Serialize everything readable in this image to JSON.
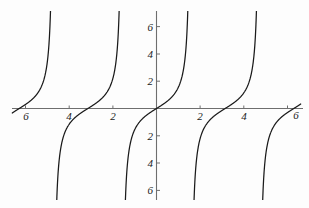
{
  "chart_data": {
    "type": "line",
    "title": "",
    "subtitle": "",
    "xlabel": "",
    "ylabel": "",
    "function": "tan(x)",
    "xlim": [
      -6.6,
      6.6
    ],
    "ylim": [
      -6.8,
      6.8
    ],
    "grid": false,
    "legend": null,
    "x_ticks": [
      {
        "value": -6,
        "label": "6"
      },
      {
        "value": -4,
        "label": "4"
      },
      {
        "value": -2,
        "label": "2"
      },
      {
        "value": 2,
        "label": "2"
      },
      {
        "value": 4,
        "label": "4"
      },
      {
        "value": 6,
        "label": "6"
      }
    ],
    "y_ticks": [
      {
        "value": 6,
        "label": "6"
      },
      {
        "value": 4,
        "label": "4"
      },
      {
        "value": 2,
        "label": "2"
      },
      {
        "value": -2,
        "label": "2"
      },
      {
        "value": -4,
        "label": "4"
      },
      {
        "value": -6,
        "label": "6"
      }
    ],
    "asymptotes": [
      -4.712,
      -1.571,
      1.571,
      4.712
    ],
    "branches": [
      {
        "x_start": -6.6,
        "x_end": -4.712,
        "note": "rises from y=-6.8 off-left edge toward +inf at x=-3pi/2"
      },
      {
        "x_start": -4.712,
        "x_end": -1.571,
        "note": "rises from -inf at x=-3pi/2 through (-pi,0) to +inf at x=-pi/2"
      },
      {
        "x_start": -1.571,
        "x_end": 1.571,
        "note": "rises from -inf at x=-pi/2 through (0,0) to +inf at x=pi/2"
      },
      {
        "x_start": 1.571,
        "x_end": 4.712,
        "note": "rises from -inf at x=pi/2 through (pi,0) to +inf at x=3pi/2"
      },
      {
        "x_start": 4.712,
        "x_end": 6.6,
        "note": "rises from -inf at x=3pi/2 toward right edge"
      }
    ],
    "series": [
      {
        "name": "tan(x)",
        "color": "#1a1a1a",
        "x": [
          -6.6,
          -6.4,
          -6.2,
          -6.0,
          -5.8,
          -5.6,
          -5.4,
          -5.2,
          -5.0,
          -4.9,
          -4.85,
          -4.8,
          -4.76,
          -4.66,
          -4.62,
          -4.56,
          -4.46,
          -4.3,
          -4.1,
          -3.9,
          -3.7,
          -3.5,
          -3.3,
          -3.14,
          -3.0,
          -2.8,
          -2.6,
          -2.4,
          -2.2,
          -2.0,
          -1.85,
          -1.75,
          -1.68,
          -1.62,
          -1.52,
          -1.46,
          -1.4,
          -1.3,
          -1.15,
          -1.0,
          -0.8,
          -0.6,
          -0.4,
          -0.2,
          0.0,
          0.2,
          0.4,
          0.6,
          0.8,
          1.0,
          1.15,
          1.3,
          1.4,
          1.46,
          1.52,
          1.62,
          1.68,
          1.75,
          1.85,
          2.0,
          2.2,
          2.4,
          2.6,
          2.8,
          3.0,
          3.14,
          3.3,
          3.5,
          3.7,
          3.9,
          4.1,
          4.3,
          4.46,
          4.56,
          4.62,
          4.66,
          4.76,
          4.8,
          4.85,
          4.9,
          5.0,
          5.2,
          5.4,
          5.6,
          5.8,
          6.0,
          6.2,
          6.4,
          6.6
        ],
        "y": [
          -0.27,
          -0.48,
          -0.7,
          -0.95,
          -1.26,
          -1.68,
          -2.35,
          -3.74,
          -8.35,
          -20.4,
          -46.1,
          120.0,
          20.0,
          6.6,
          4.9,
          3.5,
          2.37,
          1.53,
          1.03,
          0.74,
          0.51,
          0.33,
          0.15,
          0.0,
          -0.14,
          -0.36,
          -0.6,
          -0.92,
          -1.37,
          -2.19,
          -3.33,
          -5.52,
          -11.1,
          -35.0,
          19.7,
          9.89,
          5.8,
          3.6,
          2.23,
          1.56,
          1.03,
          0.68,
          0.42,
          0.2,
          0.0,
          0.2,
          0.42,
          0.68,
          1.03,
          1.56,
          2.23,
          3.6,
          5.8,
          9.89,
          19.7,
          -35.0,
          -11.1,
          -5.52,
          -3.33,
          -2.19,
          -1.37,
          -0.92,
          -0.6,
          -0.36,
          -0.14,
          0.0,
          0.15,
          0.33,
          0.51,
          0.74,
          1.03,
          1.53,
          2.37,
          3.5,
          4.9,
          6.6,
          20.0,
          120.0,
          -46.1,
          -20.4,
          -8.35,
          -3.74,
          -2.35,
          -1.68,
          -1.26,
          -0.95,
          -0.7,
          -0.48,
          -0.27
        ]
      }
    ],
    "axis_color": "#6e6e6e",
    "curve_color": "#1a1a1a",
    "background_color": "#fdfdfd"
  },
  "axes": {
    "x_axis_name": "horizontal-axis",
    "y_axis_name": "vertical-axis"
  }
}
